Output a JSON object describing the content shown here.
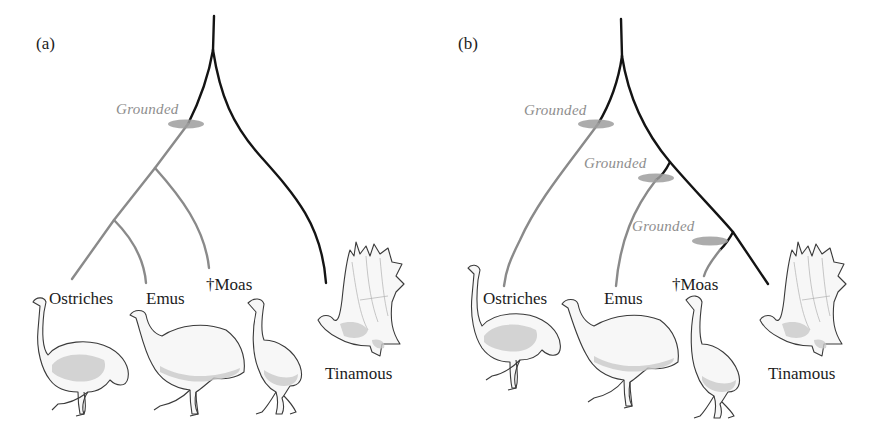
{
  "figure": {
    "colors": {
      "flighted_lineage": "#141414",
      "grounded_lineage": "#8a8a8a",
      "grounded_marker": "#9d9d9d",
      "grounded_label": "#8e8e8e",
      "text": "#1c1c1c"
    },
    "panels": [
      {
        "label": "(a)",
        "hypothesis": "single loss of flight",
        "grounded_events": [
          {
            "label": "Grounded"
          }
        ],
        "taxa": [
          {
            "label": "Ostriches",
            "status": "grounded"
          },
          {
            "label": "Emus",
            "status": "grounded"
          },
          {
            "label": "†Moas",
            "status": "grounded",
            "extinct": true
          },
          {
            "label": "Tinamous",
            "status": "flighted"
          }
        ]
      },
      {
        "label": "(b)",
        "hypothesis": "multiple independent losses of flight",
        "grounded_events": [
          {
            "label": "Grounded"
          },
          {
            "label": "Grounded"
          },
          {
            "label": "Grounded"
          }
        ],
        "taxa": [
          {
            "label": "Ostriches",
            "status": "grounded"
          },
          {
            "label": "Emus",
            "status": "grounded"
          },
          {
            "label": "†Moas",
            "status": "grounded",
            "extinct": true
          },
          {
            "label": "Tinamous",
            "status": "flighted"
          }
        ]
      }
    ]
  }
}
